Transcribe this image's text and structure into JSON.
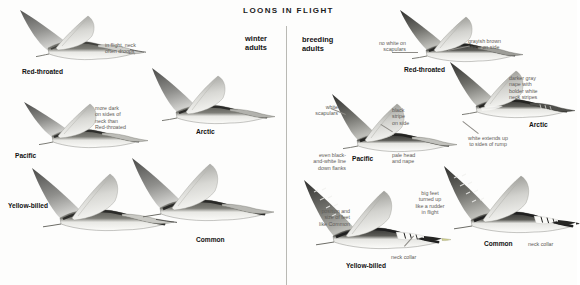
{
  "plate": {
    "title": "LOONS IN FLIGHT",
    "background": "#fdfdfc",
    "divider_color": "#b9b9b4",
    "text_color": "#111111",
    "note_color": "#5d5b57"
  },
  "left_panel": {
    "heading": "winter\nadults",
    "heading_line1": "winter",
    "heading_line2": "adults",
    "species": [
      {
        "label": "Red-throated"
      },
      {
        "label": "Pacific"
      },
      {
        "label": "Arctic"
      },
      {
        "label": "Yellow-billed"
      },
      {
        "label": "Common"
      }
    ],
    "notes": [
      {
        "text": "in flight, neck\noften droops",
        "line1": "in flight, neck",
        "line2": "often droops"
      },
      {
        "text": "more dark\non sides of\nneck than\nRed-throated",
        "line1": "more dark",
        "line2": "on sides of",
        "line3": "neck than",
        "line4": "Red-throated"
      }
    ]
  },
  "right_panel": {
    "heading_line1": "breeding",
    "heading_line2": "adults",
    "species": [
      {
        "label": "Red-throated"
      },
      {
        "label": "Arctic"
      },
      {
        "label": "Pacific"
      },
      {
        "label": "Yellow-billed"
      },
      {
        "label": "Common"
      }
    ],
    "notes": [
      {
        "line1": "no white on",
        "line2": "scapulars"
      },
      {
        "line1": "grayish brown",
        "line2": "stripe on side"
      },
      {
        "line1": "darker gray",
        "line2": "nape with",
        "line3": "bolder white",
        "line4": "neck stripes"
      },
      {
        "line1": "white",
        "line2": "scapulars"
      },
      {
        "line1": "black",
        "line2": "stripe",
        "line3": "on side"
      },
      {
        "line1": "white extends up",
        "line2": "to sides of rump"
      },
      {
        "line1": "even black-",
        "line2": "and-white line",
        "line3": "down flanks"
      },
      {
        "line1": "pale head",
        "line2": "and nape"
      },
      {
        "line1": "position and",
        "line2": "size of feet",
        "line3": "like Common"
      },
      {
        "line1": "big feet",
        "line2": "turned up",
        "line3": "like a rudder",
        "line4": "in flight"
      },
      {
        "line1": "neck collar"
      },
      {
        "line1": "neck collar"
      }
    ]
  }
}
